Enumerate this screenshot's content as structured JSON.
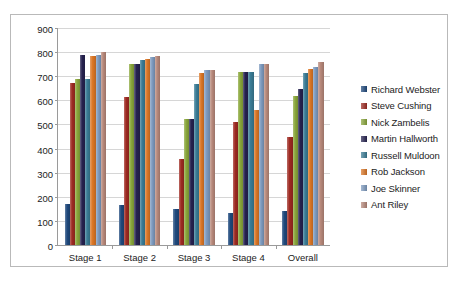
{
  "chart_data": {
    "type": "bar",
    "title": "",
    "xlabel": "",
    "ylabel": "",
    "ylim": [
      0,
      900
    ],
    "ytick_step": 100,
    "yticks": [
      0,
      100,
      200,
      300,
      400,
      500,
      600,
      700,
      800,
      900
    ],
    "grid": true,
    "legend_position": "right",
    "categories": [
      "Stage 1",
      "Stage 2",
      "Stage 3",
      "Stage 4",
      "Overall"
    ],
    "series": [
      {
        "name": "Richard Webster",
        "color": "#1F497D",
        "values": [
          170,
          165,
          150,
          133,
          140
        ]
      },
      {
        "name": "Steve Cushing",
        "color": "#9E2A22",
        "values": [
          672,
          612,
          358,
          510,
          447
        ]
      },
      {
        "name": "Nick Zambelis",
        "color": "#8AA73B",
        "values": [
          690,
          752,
          522,
          718,
          620
        ]
      },
      {
        "name": "Martin Hallworth",
        "color": "#262250",
        "values": [
          788,
          750,
          522,
          718,
          648
        ]
      },
      {
        "name": "Russell Muldoon",
        "color": "#3A7C96",
        "values": [
          690,
          768,
          667,
          718,
          712
        ]
      },
      {
        "name": "Rob Jackson",
        "color": "#DC7726",
        "values": [
          786,
          770,
          713,
          560,
          728
        ]
      },
      {
        "name": "Joe Skinner",
        "color": "#7E9BC0",
        "values": [
          790,
          778,
          727,
          750,
          740
        ]
      },
      {
        "name": "Ant Riley",
        "color": "#B8897B",
        "values": [
          800,
          784,
          727,
          750,
          757
        ]
      }
    ]
  },
  "legend": {
    "items": [
      {
        "label": "Richard Webster"
      },
      {
        "label": "Steve Cushing"
      },
      {
        "label": "Nick Zambelis"
      },
      {
        "label": "Martin Hallworth"
      },
      {
        "label": "Russell Muldoon"
      },
      {
        "label": "Rob Jackson"
      },
      {
        "label": "Joe Skinner"
      },
      {
        "label": "Ant Riley"
      }
    ]
  }
}
